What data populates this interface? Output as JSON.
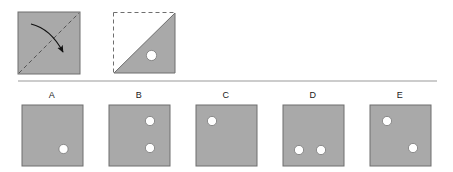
{
  "question": {
    "type": "paper-folding-hole-punch",
    "background_color": "#ffffff",
    "paper_fill": "#a9a9a9",
    "paper_stroke": "#6e6e6e",
    "hole_fill": "#ffffff",
    "hole_stroke": "#7a7a7a",
    "fold_line_color": "#555555",
    "arrow_color": "#111111",
    "divider_color": "#9a9a9a"
  },
  "prompt": {
    "fold_panel": {
      "name": "unfolded-square-with-fold-arrow",
      "square": {
        "x": 18,
        "y": 12,
        "size": 62
      },
      "fold_line": {
        "style": "dashed",
        "from": "bottom-left",
        "to": "top-right"
      },
      "arrow": {
        "style": "curved",
        "direction": "fold-top-left-onto-bottom-right"
      }
    },
    "folded_panel": {
      "name": "folded-triangle-with-punched-hole",
      "square": {
        "x": 113,
        "y": 12,
        "size": 62
      },
      "triangle": {
        "vertices": "top-right, bottom-right, bottom-left"
      },
      "ghost_edges": {
        "style": "dashed",
        "sides": [
          "top",
          "left"
        ]
      },
      "holes": [
        {
          "cx": 0.62,
          "cy": 0.7,
          "r": 0.082
        }
      ]
    }
  },
  "divider": {
    "x1": 18,
    "x2": 437,
    "y": 81
  },
  "options": [
    {
      "label": "A",
      "label_x": 52,
      "square": {
        "x": 22,
        "y": 105,
        "size": 61
      },
      "holes": [
        {
          "cx": 0.68,
          "cy": 0.72,
          "r": 0.075
        }
      ]
    },
    {
      "label": "B",
      "label_x": 139,
      "square": {
        "x": 109,
        "y": 105,
        "size": 61
      },
      "holes": [
        {
          "cx": 0.67,
          "cy": 0.26,
          "r": 0.075
        },
        {
          "cx": 0.67,
          "cy": 0.7,
          "r": 0.075
        }
      ]
    },
    {
      "label": "C",
      "label_x": 226,
      "square": {
        "x": 196,
        "y": 105,
        "size": 61
      },
      "holes": [
        {
          "cx": 0.26,
          "cy": 0.26,
          "r": 0.075
        }
      ]
    },
    {
      "label": "D",
      "label_x": 313,
      "square": {
        "x": 283,
        "y": 105,
        "size": 61
      },
      "holes": [
        {
          "cx": 0.26,
          "cy": 0.73,
          "r": 0.075
        },
        {
          "cx": 0.62,
          "cy": 0.73,
          "r": 0.075
        }
      ]
    },
    {
      "label": "E",
      "label_x": 400,
      "square": {
        "x": 370,
        "y": 105,
        "size": 61
      },
      "holes": [
        {
          "cx": 0.28,
          "cy": 0.26,
          "r": 0.075
        },
        {
          "cx": 0.7,
          "cy": 0.7,
          "r": 0.075
        }
      ]
    }
  ]
}
